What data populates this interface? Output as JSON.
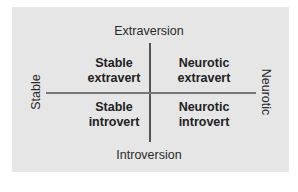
{
  "diagram": {
    "axes": {
      "top": "Extraversion",
      "bottom": "Introversion",
      "left": "Stable",
      "right": "Neurotic"
    },
    "quadrants": [
      {
        "line1": "Stable",
        "line2": "extravert"
      },
      {
        "line1": "Neurotic",
        "line2": "extravert"
      },
      {
        "line1": "Stable",
        "line2": "introvert"
      },
      {
        "line1": "Neurotic",
        "line2": "introvert"
      }
    ],
    "colors": {
      "panel": "#e6e6e6",
      "lines": "#555555",
      "text": "#222222"
    }
  }
}
